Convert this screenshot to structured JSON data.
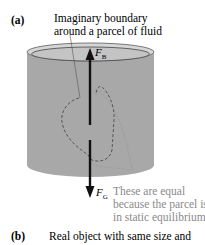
{
  "panel_a": {
    "label": "(a)",
    "boundary_note_line1": "Imaginary boundary",
    "boundary_note_line2": "around a parcel of fluid",
    "force_buoyant": "F",
    "force_buoyant_sub": "B",
    "force_gravity": "F",
    "force_gravity_sub": "G",
    "equal_note_line1": "These are equal",
    "equal_note_line2": "because the parcel is",
    "equal_note_line3": "in static equilibrium."
  },
  "panel_b": {
    "label": "(b)",
    "caption_line1": "Real object with same size and"
  },
  "colors": {
    "fluid": "#a9a9a9",
    "fluid_top": "#c9c9c9",
    "arrow": "#111111",
    "note": "#8a8a8a"
  }
}
